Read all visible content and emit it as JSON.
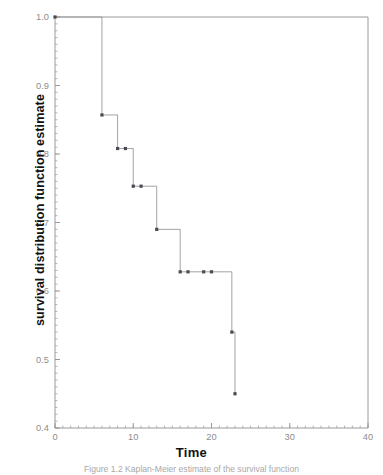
{
  "figure": {
    "caption": "Figure 1.2 Kaplan-Meier estimate of the survival function"
  },
  "chart_data": {
    "type": "line",
    "subtype": "kaplan-meier-step",
    "title": "",
    "xlabel": "Time",
    "ylabel": "survival distribution function estimate",
    "xlim": [
      0,
      40
    ],
    "ylim": [
      0.4,
      1.0
    ],
    "grid": false,
    "legend": null,
    "x_major_ticks": [
      0,
      10,
      20,
      30,
      40
    ],
    "x_major_tick_labels": [
      "0",
      "10",
      "20",
      "30",
      "40"
    ],
    "x_minor_tick_step": 1,
    "y_major_ticks": [
      0.4,
      0.5,
      0.6,
      0.7,
      0.8,
      0.9,
      1.0
    ],
    "y_major_tick_labels": [
      "0.4",
      "0.5",
      "0.6",
      "0.7",
      "0.8",
      "0.9",
      "1.0"
    ],
    "y_minor_tick_step": 0.01,
    "line_color": "#999999",
    "marker_color": "#4a4a52",
    "axis_color": "#9a9a9a",
    "series": [
      {
        "name": "survival distribution function estimate",
        "step_points": [
          {
            "x": 0,
            "y": 1.0
          },
          {
            "x": 6,
            "y": 1.0
          },
          {
            "x": 6,
            "y": 0.857
          },
          {
            "x": 8,
            "y": 0.857
          },
          {
            "x": 8,
            "y": 0.808
          },
          {
            "x": 10,
            "y": 0.808
          },
          {
            "x": 10,
            "y": 0.753
          },
          {
            "x": 13,
            "y": 0.753
          },
          {
            "x": 13,
            "y": 0.69
          },
          {
            "x": 16,
            "y": 0.69
          },
          {
            "x": 16,
            "y": 0.628
          },
          {
            "x": 22.6,
            "y": 0.628
          },
          {
            "x": 22.6,
            "y": 0.54
          },
          {
            "x": 23.0,
            "y": 0.54
          },
          {
            "x": 23.0,
            "y": 0.45
          }
        ],
        "markers": [
          {
            "x": 0,
            "y": 1.0
          },
          {
            "x": 6,
            "y": 0.857
          },
          {
            "x": 8,
            "y": 0.808
          },
          {
            "x": 9,
            "y": 0.808
          },
          {
            "x": 10,
            "y": 0.753
          },
          {
            "x": 11,
            "y": 0.753
          },
          {
            "x": 13,
            "y": 0.69
          },
          {
            "x": 16,
            "y": 0.628
          },
          {
            "x": 17,
            "y": 0.628
          },
          {
            "x": 19,
            "y": 0.628
          },
          {
            "x": 20,
            "y": 0.628
          },
          {
            "x": 22.6,
            "y": 0.54
          },
          {
            "x": 23.0,
            "y": 0.45
          }
        ]
      }
    ]
  }
}
